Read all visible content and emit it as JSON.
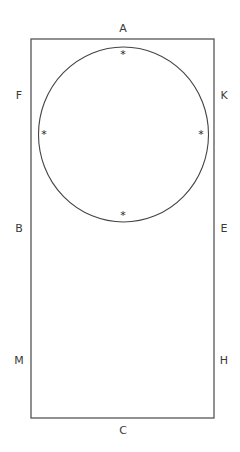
{
  "diagram": {
    "rectangle": {
      "x": 31,
      "y": 39,
      "width": 183,
      "height": 379,
      "stroke": "#555555"
    },
    "circle": {
      "cx": 123.5,
      "cy": 134.5,
      "rx": 85,
      "ry": 87.5,
      "stroke": "#444444"
    },
    "labels": [
      {
        "id": "A",
        "text": "A",
        "x": 123,
        "y": 29
      },
      {
        "id": "F",
        "text": "F",
        "x": 19,
        "y": 96
      },
      {
        "id": "K",
        "text": "K",
        "x": 224,
        "y": 96
      },
      {
        "id": "B",
        "text": "B",
        "x": 19,
        "y": 229
      },
      {
        "id": "E",
        "text": "E",
        "x": 224,
        "y": 229
      },
      {
        "id": "M",
        "text": "M",
        "x": 19,
        "y": 361
      },
      {
        "id": "H",
        "text": "H",
        "x": 224,
        "y": 361
      },
      {
        "id": "C",
        "text": "C",
        "x": 123,
        "y": 431
      }
    ],
    "markers": [
      {
        "position": "top",
        "glyph": "*",
        "x": 123,
        "y": 54
      },
      {
        "position": "left",
        "glyph": "*",
        "x": 44,
        "y": 134
      },
      {
        "position": "right",
        "glyph": "*",
        "x": 201,
        "y": 134
      },
      {
        "position": "bottom",
        "glyph": "*",
        "x": 123,
        "y": 215
      }
    ]
  }
}
